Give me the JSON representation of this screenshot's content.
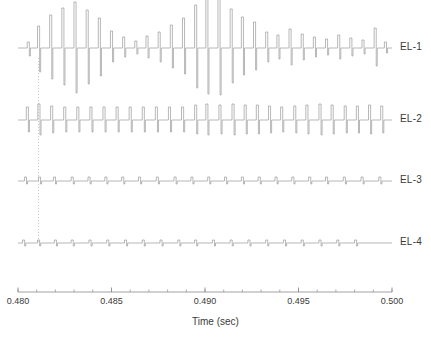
{
  "figure": {
    "background": "#ffffff",
    "trace_color": "#9a9a9a",
    "axis_color": "#8c8c8c",
    "text_color": "#3a3a3a",
    "marker_color": "#b0b0b0"
  },
  "axis": {
    "xlabel": "Time (sec)",
    "x_min": 0.48,
    "x_max": 0.5,
    "major_ticks": [
      0.48,
      0.485,
      0.49,
      0.495,
      0.5
    ],
    "major_tick_labels": [
      "0.480",
      "0.485",
      "0.490",
      "0.495",
      "0.500"
    ],
    "minor_tick_step": 0.001,
    "grid": false
  },
  "marker": {
    "name": "event-cursor",
    "style": "dotted",
    "x": 0.4811,
    "y_top": 58,
    "y_bottom": 243
  },
  "channels": [
    {
      "label": "EL-1",
      "baseline_y": 48,
      "label_y": 41
    },
    {
      "label": "EL-2",
      "baseline_y": 120,
      "label_y": 113
    },
    {
      "label": "EL-3",
      "baseline_y": 181,
      "label_y": 174
    },
    {
      "label": "EL-4",
      "baseline_y": 243,
      "label_y": 236
    }
  ],
  "chart_data": {
    "type": "line",
    "title": "",
    "subtitle": "",
    "xlabel": "Time (sec)",
    "ylabel": "",
    "xlim": [
      0.48,
      0.5
    ],
    "legend_position": "right",
    "series": [
      {
        "name": "EL-1",
        "spike_times": [
          0.48055,
          0.4811,
          0.48175,
          0.4824,
          0.48305,
          0.4837,
          0.48435,
          0.485,
          0.48565,
          0.4863,
          0.4869,
          0.48755,
          0.4882,
          0.48885,
          0.4895,
          0.4901,
          0.49075,
          0.4914,
          0.492,
          0.49265,
          0.4933,
          0.4939,
          0.49455,
          0.4952,
          0.49585,
          0.4965,
          0.49715,
          0.4978,
          0.49845,
          0.4991,
          0.49965
        ],
        "amp_up": [
          6,
          22,
          33,
          40,
          46,
          38,
          30,
          17,
          11,
          7,
          12,
          16,
          23,
          30,
          43,
          49,
          50,
          39,
          31,
          26,
          16,
          13,
          19,
          14,
          11,
          9,
          13,
          10,
          8,
          20,
          6
        ],
        "amp_down": [
          8,
          24,
          31,
          37,
          45,
          36,
          28,
          14,
          9,
          6,
          10,
          14,
          20,
          26,
          40,
          46,
          47,
          35,
          27,
          22,
          14,
          11,
          17,
          12,
          9,
          7,
          11,
          8,
          6,
          18,
          5
        ]
      },
      {
        "name": "EL-2",
        "spike_times": [
          0.4805,
          0.48112,
          0.4818,
          0.4825,
          0.4832,
          0.4839,
          0.4846,
          0.4853,
          0.486,
          0.4867,
          0.4874,
          0.4881,
          0.4888,
          0.4895,
          0.4901,
          0.4908,
          0.4915,
          0.49215,
          0.4928,
          0.49345,
          0.4941,
          0.4948,
          0.49545,
          0.49615,
          0.4968,
          0.4975,
          0.49815,
          0.4988,
          0.49945
        ],
        "amp_up": [
          13,
          16,
          14,
          13,
          13,
          13,
          13,
          13,
          13,
          13,
          13,
          13,
          13,
          15,
          16,
          15,
          16,
          15,
          15,
          14,
          13,
          14,
          15,
          16,
          15,
          14,
          14,
          15,
          14
        ],
        "amp_down": [
          12,
          15,
          13,
          12,
          12,
          12,
          12,
          12,
          12,
          12,
          12,
          12,
          12,
          14,
          15,
          14,
          15,
          14,
          14,
          13,
          12,
          13,
          14,
          15,
          14,
          13,
          13,
          14,
          13
        ]
      },
      {
        "name": "EL-3",
        "spike_times": [
          0.4804,
          0.48115,
          0.48195,
          0.4829,
          0.4838,
          0.4847,
          0.4856,
          0.4865,
          0.48745,
          0.4884,
          0.4893,
          0.4902,
          0.4911,
          0.492,
          0.4929,
          0.4938,
          0.4947,
          0.4956,
          0.4965,
          0.49745,
          0.4984,
          0.49935
        ],
        "amp_up": [
          4,
          4,
          4,
          4,
          4,
          4,
          4,
          4,
          4,
          4,
          4,
          4,
          4,
          4,
          4,
          4,
          4,
          4,
          4,
          4,
          4,
          4
        ],
        "amp_down": [
          3,
          3,
          3,
          3,
          3,
          3,
          3,
          3,
          3,
          3,
          3,
          3,
          3,
          3,
          3,
          3,
          3,
          3,
          3,
          3,
          3,
          3
        ]
      },
      {
        "name": "EL-4",
        "spike_times": [
          0.4803,
          0.4811,
          0.482,
          0.4829,
          0.48385,
          0.4848,
          0.48575,
          0.4867,
          0.48765,
          0.4886,
          0.4895,
          0.49045,
          0.4914,
          0.49235,
          0.4933,
          0.49425,
          0.4952,
          0.49615,
          0.4971,
          0.49805
        ],
        "amp_up": [
          3,
          3,
          3,
          3,
          3,
          3,
          3,
          3,
          3,
          3,
          3,
          3,
          3,
          3,
          3,
          3,
          3,
          3,
          3,
          3
        ],
        "amp_down": [
          3,
          3,
          3,
          3,
          3,
          3,
          3,
          3,
          3,
          3,
          3,
          3,
          3,
          3,
          3,
          3,
          3,
          3,
          3,
          3
        ]
      }
    ]
  }
}
